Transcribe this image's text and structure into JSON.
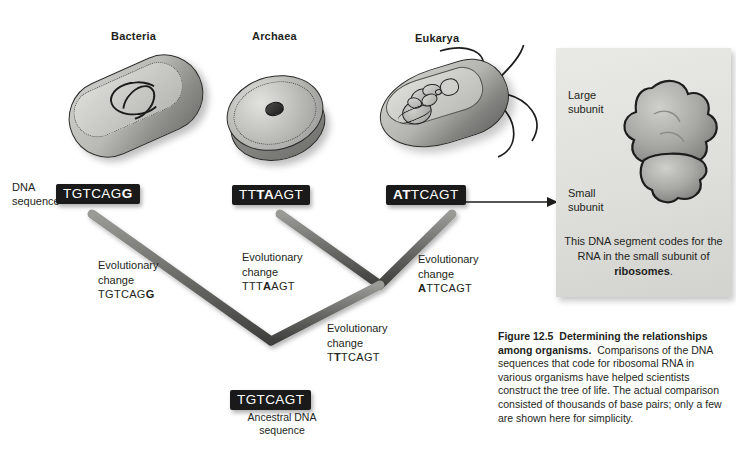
{
  "figure": {
    "domains": [
      {
        "name": "Bacteria"
      },
      {
        "name": "Archaea"
      },
      {
        "name": "Eukarya"
      }
    ],
    "dna_sequence_label": "DNA\nsequence",
    "tip_sequences": [
      {
        "organism": "Bacteria",
        "prefix": "TGTCAG",
        "mutation": "G",
        "suffix": ""
      },
      {
        "organism": "Archaea",
        "prefix": "TT",
        "mutation": "TA",
        "suffix": "AGT"
      },
      {
        "organism": "Eukarya",
        "prefix": "",
        "mutation": "AT",
        "suffix": "TCAGT"
      }
    ],
    "ancestral": {
      "sequence": "TGTCAGT",
      "label_line1": "Ancestral DNA",
      "label_line2": "sequence"
    },
    "evolutionary_changes": [
      {
        "id": "bacteria-branch",
        "line1": "Evolutionary",
        "line2": "change",
        "prefix": "TGTCAG",
        "mutation": "G",
        "suffix": ""
      },
      {
        "id": "archaea-branch",
        "line1": "Evolutionary",
        "line2": "change",
        "prefix": "TTT",
        "mutation": "A",
        "suffix": "AGT"
      },
      {
        "id": "eukarya-branch",
        "line1": "Evolutionary",
        "line2": "change",
        "prefix": "",
        "mutation": "A",
        "suffix": "TTCAGT"
      },
      {
        "id": "archaea-eukarya-ancestor",
        "line1": "Evolutionary",
        "line2": "change",
        "prefix": "T",
        "mutation": "T",
        "suffix": "TCAGT"
      }
    ],
    "inset": {
      "large_subunit_line1": "Large",
      "large_subunit_line2": "subunit",
      "small_subunit_line1": "Small",
      "small_subunit_line2": "subunit",
      "note_line1": "This DNA segment codes for",
      "note_line2": "the RNA in the small subunit",
      "note_bold": "ribosomes",
      "note_prefix_last": "of ",
      "note_suffix_last": "."
    },
    "caption": {
      "figure_number": "Figure 12.5",
      "title": "Determining the relationships among organisms.",
      "body": "Comparisons of the DNA sequences that code for ribosomal RNA in various organisms have helped scientists construct the tree of life. The actual comparison consisted of thousands of base pairs; only a few are shown here for simplicity."
    },
    "colors": {
      "background": "#ffffff",
      "chip_background": "#1a1a1a",
      "chip_text": "#ffffff",
      "text": "#231f20",
      "branch": "#6f6f6c",
      "inset_background": "#e3e3df"
    }
  }
}
